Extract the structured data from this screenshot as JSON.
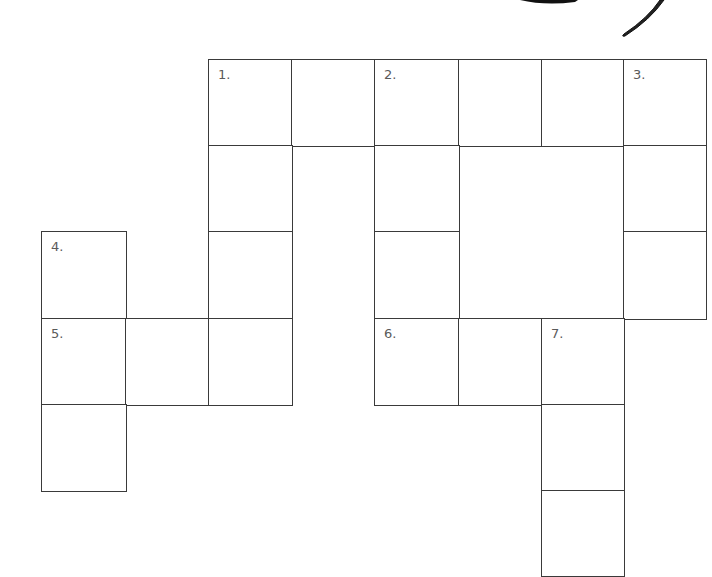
{
  "puzzle": {
    "type": "crossword",
    "line_color": "#3a3a3a",
    "number_color": "#5a5a5a",
    "col_edges": [
      42,
      126,
      209,
      292,
      375,
      459,
      542,
      624,
      706
    ],
    "row_edges": [
      60,
      146,
      232,
      319,
      405,
      491,
      576
    ],
    "cells": [
      {
        "row": 0,
        "col": 2,
        "number": "1."
      },
      {
        "row": 0,
        "col": 3,
        "number": ""
      },
      {
        "row": 0,
        "col": 4,
        "number": "2."
      },
      {
        "row": 0,
        "col": 5,
        "number": ""
      },
      {
        "row": 0,
        "col": 6,
        "number": ""
      },
      {
        "row": 0,
        "col": 7,
        "number": "3."
      },
      {
        "row": 1,
        "col": 2,
        "number": ""
      },
      {
        "row": 1,
        "col": 4,
        "number": ""
      },
      {
        "row": 1,
        "col": 7,
        "number": ""
      },
      {
        "row": 2,
        "col": 0,
        "number": "4."
      },
      {
        "row": 2,
        "col": 2,
        "number": ""
      },
      {
        "row": 2,
        "col": 4,
        "number": ""
      },
      {
        "row": 2,
        "col": 7,
        "number": ""
      },
      {
        "row": 3,
        "col": 0,
        "number": "5."
      },
      {
        "row": 3,
        "col": 1,
        "number": ""
      },
      {
        "row": 3,
        "col": 2,
        "number": ""
      },
      {
        "row": 3,
        "col": 4,
        "number": "6."
      },
      {
        "row": 3,
        "col": 5,
        "number": ""
      },
      {
        "row": 3,
        "col": 6,
        "number": "7."
      },
      {
        "row": 4,
        "col": 0,
        "number": ""
      },
      {
        "row": 4,
        "col": 6,
        "number": ""
      },
      {
        "row": 5,
        "col": 6,
        "number": ""
      }
    ]
  },
  "decoration": {
    "description": "partial black brush-stroke illustration at top edge",
    "icon": "brush-stroke-decoration"
  }
}
